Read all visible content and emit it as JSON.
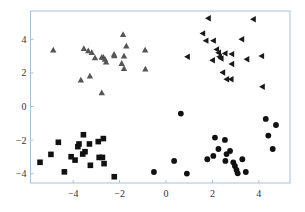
{
  "chart_data": {
    "type": "scatter",
    "title": "",
    "xlabel": "",
    "ylabel": "",
    "xlim": [
      -5.8,
      5.4
    ],
    "ylim": [
      -4.6,
      5.7
    ],
    "xticks": [
      -4,
      -2,
      0,
      2,
      4
    ],
    "yticks": [
      -4,
      -2,
      0,
      2,
      4
    ],
    "xtick_labels": [
      "-4",
      "-2",
      "0",
      "2",
      "4"
    ],
    "ytick_labels": [
      "-4",
      "-2",
      "0",
      "2",
      "4"
    ],
    "grid": false,
    "legend": null,
    "frame_color": "#a8c0d8",
    "series": [
      {
        "name": "triangles",
        "marker": "triangle-up",
        "color": "#555555",
        "points": [
          [
            -4.86,
            3.36
          ],
          [
            -1.85,
            4.29
          ],
          [
            -1.71,
            3.6
          ],
          [
            -3.54,
            3.46
          ],
          [
            -3.35,
            3.32
          ],
          [
            -3.2,
            3.22
          ],
          [
            -3.06,
            2.91
          ],
          [
            -2.77,
            2.93
          ],
          [
            -2.7,
            2.93
          ],
          [
            -2.63,
            2.81
          ],
          [
            -2.58,
            2.65
          ],
          [
            -2.24,
            3.11
          ],
          [
            -2.23,
            3.03
          ],
          [
            -1.81,
            3.01
          ],
          [
            -1.91,
            2.57
          ],
          [
            -1.81,
            2.27
          ],
          [
            -0.9,
            3.36
          ],
          [
            -0.89,
            2.23
          ],
          [
            -3.28,
            1.82
          ],
          [
            -3.67,
            1.58
          ],
          [
            -2.77,
            0.82
          ]
        ]
      },
      {
        "name": "left-triangles",
        "marker": "triangle-left",
        "color": "#1a1a1a",
        "points": [
          [
            1.82,
            5.25
          ],
          [
            3.76,
            5.19
          ],
          [
            1.58,
            4.35
          ],
          [
            1.72,
            3.92
          ],
          [
            2.04,
            3.92
          ],
          [
            3.26,
            4.0
          ],
          [
            0.92,
            2.96
          ],
          [
            2.18,
            3.4
          ],
          [
            2.26,
            3.2
          ],
          [
            2.3,
            2.96
          ],
          [
            2.54,
            3.16
          ],
          [
            2.83,
            3.12
          ],
          [
            2.0,
            2.75
          ],
          [
            2.37,
            2.86
          ],
          [
            3.48,
            2.81
          ],
          [
            4.12,
            3.0
          ],
          [
            2.83,
            2.53
          ],
          [
            2.44,
            2.02
          ],
          [
            2.61,
            1.62
          ],
          [
            2.8,
            1.62
          ],
          [
            4.15,
            1.18
          ]
        ]
      },
      {
        "name": "squares",
        "marker": "square",
        "color": "#111111",
        "points": [
          [
            -5.43,
            -3.32
          ],
          [
            -4.64,
            -2.13
          ],
          [
            -4.96,
            -2.85
          ],
          [
            -4.38,
            -3.89
          ],
          [
            -4.09,
            -2.99
          ],
          [
            -3.92,
            -3.19
          ],
          [
            -3.8,
            -2.39
          ],
          [
            -3.75,
            -2.23
          ],
          [
            -3.56,
            -1.68
          ],
          [
            -3.49,
            -2.69
          ],
          [
            -3.59,
            -2.83
          ],
          [
            -3.3,
            -2.23
          ],
          [
            -3.26,
            -3.5
          ],
          [
            -2.92,
            -2.09
          ],
          [
            -2.88,
            -3.03
          ],
          [
            -2.7,
            -1.91
          ],
          [
            -2.74,
            -3.03
          ],
          [
            -2.67,
            -3.4
          ],
          [
            -2.23,
            -4.18
          ]
        ]
      },
      {
        "name": "circles",
        "marker": "circle",
        "color": "#111111",
        "points": [
          [
            -0.52,
            -3.9
          ],
          [
            0.64,
            -0.42
          ],
          [
            0.35,
            -3.24
          ],
          [
            0.9,
            -3.99
          ],
          [
            2.11,
            -1.85
          ],
          [
            2.54,
            -1.99
          ],
          [
            2.26,
            -2.53
          ],
          [
            1.78,
            -3.14
          ],
          [
            2.04,
            -2.94
          ],
          [
            2.76,
            -2.65
          ],
          [
            2.61,
            -2.83
          ],
          [
            2.56,
            -3.24
          ],
          [
            2.9,
            -3.32
          ],
          [
            2.97,
            -3.54
          ],
          [
            3.04,
            -3.78
          ],
          [
            3.09,
            -3.98
          ],
          [
            3.29,
            -3.14
          ],
          [
            3.44,
            -3.9
          ],
          [
            4.3,
            -0.74
          ],
          [
            4.74,
            -1.1
          ],
          [
            4.41,
            -1.73
          ],
          [
            4.6,
            -2.53
          ]
        ]
      }
    ]
  }
}
